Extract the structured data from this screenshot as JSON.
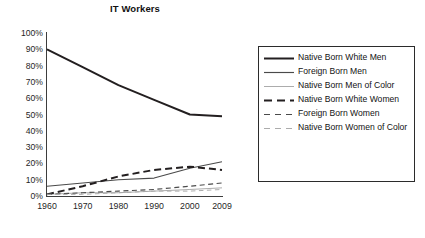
{
  "chart_data": {
    "type": "line",
    "title": "IT Workers",
    "xlabel": "",
    "ylabel": "",
    "x": [
      "1960",
      "1970",
      "1980",
      "1990",
      "2000",
      "2009"
    ],
    "xlim": [
      1960,
      2009
    ],
    "ylim": [
      0,
      100
    ],
    "yticks": [
      "0%",
      "10%",
      "20%",
      "30%",
      "40%",
      "50%",
      "60%",
      "70%",
      "80%",
      "90%",
      "100%"
    ],
    "ytick_values": [
      0,
      10,
      20,
      30,
      40,
      50,
      60,
      70,
      80,
      90,
      100
    ],
    "grid": false,
    "legend_position": "right-outside",
    "y_axis_unit": "percent",
    "series": [
      {
        "name": "Native Born White Men",
        "values": [
          90,
          79,
          68,
          59,
          50,
          49
        ],
        "style": "solid",
        "weight": "thick",
        "color": "#231f20"
      },
      {
        "name": "Foreign Born Men",
        "values": [
          6,
          8,
          10,
          11,
          17,
          21
        ],
        "style": "solid",
        "weight": "medium",
        "color": "#4a4a4a"
      },
      {
        "name": "Native Born Men of Color",
        "values": [
          1,
          2,
          2,
          3,
          4,
          5
        ],
        "style": "solid",
        "weight": "light",
        "color": "#a8a8a8"
      },
      {
        "name": "Native Born White Women",
        "values": [
          1,
          6,
          12,
          16,
          18,
          16
        ],
        "style": "dashed",
        "weight": "thick",
        "color": "#231f20"
      },
      {
        "name": "Foreign Born Women",
        "values": [
          1,
          2,
          3,
          4,
          6,
          8
        ],
        "style": "dashed",
        "weight": "medium",
        "color": "#4a4a4a"
      },
      {
        "name": "Native Born Women of Color",
        "values": [
          1,
          1,
          2,
          3,
          3,
          4
        ],
        "style": "dashed",
        "weight": "light",
        "color": "#a8a8a8"
      }
    ]
  },
  "legend": {
    "items": [
      {
        "label": "Native Born White Men"
      },
      {
        "label": "Foreign Born Men"
      },
      {
        "label": "Native Born Men of Color"
      },
      {
        "label": "Native Born White Women"
      },
      {
        "label": "Foreign Born Women"
      },
      {
        "label": "Native Born Women of Color"
      }
    ]
  }
}
